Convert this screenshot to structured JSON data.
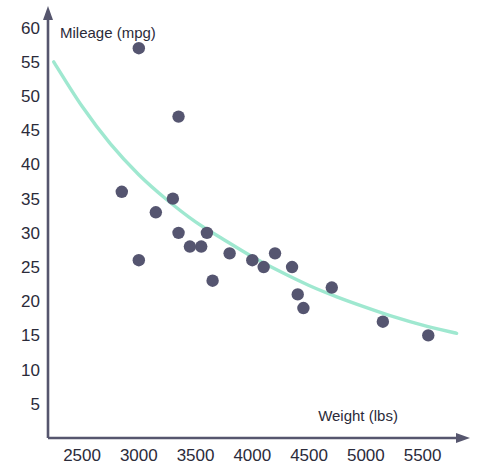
{
  "chart_data": {
    "type": "scatter",
    "title": "",
    "xlabel": "Weight (lbs)",
    "ylabel": "Mileage (mpg)",
    "xlim": [
      2200,
      5900
    ],
    "ylim": [
      0,
      62
    ],
    "grid": false,
    "legend": null,
    "xticks": [
      2500,
      3000,
      3500,
      4000,
      4500,
      5000,
      5500
    ],
    "yticks": [
      5,
      10,
      15,
      20,
      25,
      30,
      35,
      40,
      45,
      50,
      55,
      60
    ],
    "point_color": "#555570",
    "curve_color": "#9fe8d0",
    "axis_color": "#56566e",
    "series": [
      {
        "name": "cars",
        "points": [
          {
            "x": 2850,
            "y": 36
          },
          {
            "x": 3000,
            "y": 57
          },
          {
            "x": 3000,
            "y": 26
          },
          {
            "x": 3150,
            "y": 33
          },
          {
            "x": 3300,
            "y": 35
          },
          {
            "x": 3350,
            "y": 47
          },
          {
            "x": 3350,
            "y": 30
          },
          {
            "x": 3450,
            "y": 28
          },
          {
            "x": 3550,
            "y": 28
          },
          {
            "x": 3600,
            "y": 30
          },
          {
            "x": 3650,
            "y": 23
          },
          {
            "x": 3800,
            "y": 27
          },
          {
            "x": 4000,
            "y": 26
          },
          {
            "x": 4100,
            "y": 25
          },
          {
            "x": 4200,
            "y": 27
          },
          {
            "x": 4350,
            "y": 25
          },
          {
            "x": 4400,
            "y": 21
          },
          {
            "x": 4450,
            "y": 19
          },
          {
            "x": 4700,
            "y": 22
          },
          {
            "x": 5150,
            "y": 17
          },
          {
            "x": 5550,
            "y": 15
          }
        ]
      }
    ],
    "fit_curve": {
      "name": "trend",
      "points": [
        {
          "x": 2250,
          "y": 55
        },
        {
          "x": 2500,
          "y": 48.5
        },
        {
          "x": 2750,
          "y": 43
        },
        {
          "x": 3000,
          "y": 38.5
        },
        {
          "x": 3250,
          "y": 34.8
        },
        {
          "x": 3500,
          "y": 31.6
        },
        {
          "x": 3750,
          "y": 29
        },
        {
          "x": 4000,
          "y": 26.5
        },
        {
          "x": 4250,
          "y": 24.3
        },
        {
          "x": 4500,
          "y": 22.3
        },
        {
          "x": 4750,
          "y": 20.6
        },
        {
          "x": 5000,
          "y": 19.1
        },
        {
          "x": 5250,
          "y": 17.7
        },
        {
          "x": 5500,
          "y": 16.5
        },
        {
          "x": 5800,
          "y": 15.3
        }
      ]
    }
  }
}
